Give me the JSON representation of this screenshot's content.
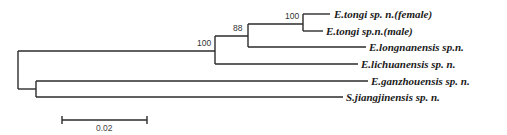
{
  "tree": {
    "type": "phylogenetic-tree",
    "taxa": [
      "E.tongi sp. n.(female)",
      "E.tongi sp.n.(male)",
      "E.longnanensis sp.n.",
      "E.lichuanensis sp. n.",
      "E.ganzhouensis sp. n.",
      "S.jiangjinensis sp. n."
    ],
    "bootstrap": {
      "tongi_clade": "100",
      "longnanensis_clade": "88",
      "upper_clade": "100"
    },
    "scale_bar": {
      "label": "0.02"
    }
  }
}
